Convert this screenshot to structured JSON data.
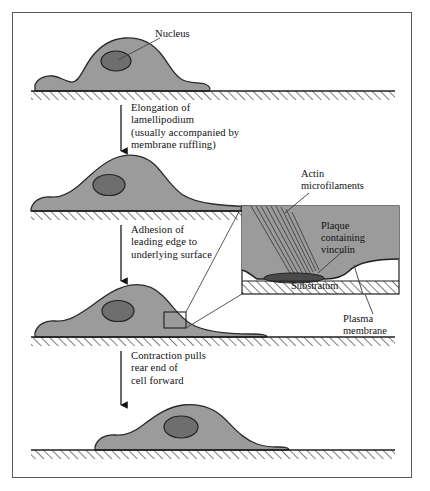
{
  "figure": {
    "kind": "cell-locomotion-diagram",
    "background": "#ffffff",
    "frame_color": "#55585c"
  },
  "colors": {
    "cell_fill": "#9b9b9b",
    "cell_stroke": "#2b2b2b",
    "nucleus_fill": "#6e6e6e",
    "nucleus_stroke": "#222222",
    "plaque_fill": "#4a4a4a",
    "hatch_stroke": "#1f1f1f",
    "leader_line": "#444444",
    "arrow_color": "#111111"
  },
  "labels": {
    "nucleus": "Nucleus"
  },
  "steps": [
    {
      "id": "step-1-spread-cell",
      "caption": "Elongation of\nlamellipodium\n(usually accompanied by\nmembrane ruffling)"
    },
    {
      "id": "step-2-elongated-cell",
      "caption": "Adhesion of\nleading edge to\nunderlying surface"
    },
    {
      "id": "step-3-adhered-cell",
      "caption": "Contraction pulls\nrear end of\ncell forward"
    },
    {
      "id": "step-4-contracted-cell",
      "caption": ""
    }
  ],
  "inset": {
    "title_actin": "Actin\nmicrofilaments",
    "label_plaque": "Plaque\ncontaining\nvinculin",
    "label_substratum": "Substratum",
    "label_plasma_membrane": "Plasma\nmembrane"
  }
}
